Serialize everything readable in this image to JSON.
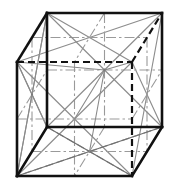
{
  "figure": {
    "kind": "3d-wireframe-diagram",
    "projection": "oblique-cabinet",
    "background_color": "#ffffff",
    "line_colors": {
      "visible_edge": "#111111",
      "hidden_edge": "#111111",
      "diagonal": "#8d8d8d",
      "median": "#9a9a9a"
    },
    "canvas": {
      "width": 172,
      "height": 191
    }
  },
  "geometry": {
    "note": "Oblique projection. Front face square; back face offset by dx=-30, dy=+49.",
    "offset": {
      "dx": -30,
      "dy": 49
    },
    "vertices": {
      "front_top_left": {
        "name": "A",
        "x": 47,
        "y": 13
      },
      "front_top_right": {
        "name": "B",
        "x": 162,
        "y": 13
      },
      "front_bottom_right": {
        "name": "C",
        "x": 162,
        "y": 127
      },
      "front_bottom_left": {
        "name": "D",
        "x": 47,
        "y": 127
      },
      "back_top_left": {
        "name": "E",
        "x": 17,
        "y": 62
      },
      "back_top_right": {
        "name": "F",
        "x": 132,
        "y": 62
      },
      "back_bottom_right": {
        "name": "G",
        "x": 132,
        "y": 176
      },
      "back_bottom_left": {
        "name": "H",
        "x": 17,
        "y": 176
      }
    },
    "face_centers": {
      "front": {
        "name": "front-face-center",
        "x": 104.5,
        "y": 70
      },
      "back": {
        "name": "back-face-center",
        "x": 74.5,
        "y": 119
      },
      "left": {
        "name": "left-face-center",
        "x": 32,
        "y": 94.5
      },
      "right": {
        "name": "right-face-center",
        "x": 147,
        "y": 94.5
      },
      "top": {
        "name": "top-face-center",
        "x": 89.5,
        "y": 37.5
      },
      "bottom": {
        "name": "bottom-face-center",
        "x": 89.5,
        "y": 151.5
      }
    },
    "hidden_edges": [
      "back_top_left -> back_top_right",
      "back_top_right -> back_bottom_right",
      "back_top_right -> front_top_right"
    ],
    "visible_edges": [
      "front_top_left -> front_top_right",
      "front_top_right -> front_bottom_right",
      "front_bottom_right -> front_bottom_left",
      "front_bottom_left -> front_top_left",
      "back_top_left -> back_bottom_left",
      "back_bottom_left -> back_bottom_right",
      "back_bottom_right -> front_bottom_right",
      "front_top_left -> back_top_left",
      "front_bottom_left -> back_bottom_left"
    ],
    "star_hubs": [
      {
        "label": "front-face-star",
        "x": 104.5,
        "y": 70,
        "spokes": 8
      },
      {
        "label": "bottom-face-star",
        "x": 89.5,
        "y": 151.5,
        "spokes": 8
      },
      {
        "label": "left-face-star",
        "x": 32,
        "y": 94.5,
        "spokes": 8
      }
    ]
  }
}
